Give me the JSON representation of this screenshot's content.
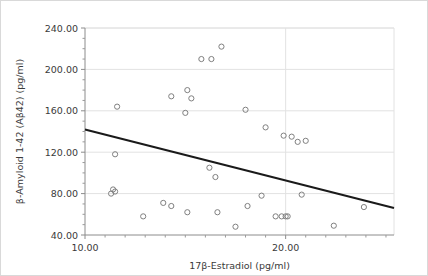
{
  "chart_data": {
    "type": "scatter",
    "title": "",
    "xlabel": "17β-Estradiol (pg/ml)",
    "ylabel": "β-Amyloid 1-42 (Aβ42) (pg/ml)",
    "xlim": [
      10.0,
      25.4
    ],
    "ylim": [
      40.0,
      240.0
    ],
    "xticks": [
      10.0,
      20.0
    ],
    "xtick_labels": [
      "10.00",
      "20.00"
    ],
    "yticks": [
      40.0,
      80.0,
      120.0,
      160.0,
      200.0,
      240.0
    ],
    "ytick_labels": [
      "40.00",
      "80.00",
      "120.00",
      "160.00",
      "200.00",
      "240.00"
    ],
    "grid": true,
    "grid_color": "#e2e2e2",
    "marker": "open-circle",
    "marker_color": "#808080",
    "legend": "none",
    "points": [
      {
        "x": 11.6,
        "y": 164.0
      },
      {
        "x": 11.5,
        "y": 118.0
      },
      {
        "x": 11.4,
        "y": 84.0
      },
      {
        "x": 11.3,
        "y": 80.0
      },
      {
        "x": 11.5,
        "y": 82.0
      },
      {
        "x": 12.9,
        "y": 58.0
      },
      {
        "x": 13.9,
        "y": 71.0
      },
      {
        "x": 14.3,
        "y": 68.0
      },
      {
        "x": 14.3,
        "y": 174.0
      },
      {
        "x": 15.0,
        "y": 158.0
      },
      {
        "x": 15.1,
        "y": 180.0
      },
      {
        "x": 15.3,
        "y": 172.0
      },
      {
        "x": 15.1,
        "y": 62.0
      },
      {
        "x": 15.8,
        "y": 210.0
      },
      {
        "x": 16.3,
        "y": 210.0
      },
      {
        "x": 16.8,
        "y": 222.0
      },
      {
        "x": 16.2,
        "y": 105.0
      },
      {
        "x": 16.5,
        "y": 96.0
      },
      {
        "x": 16.6,
        "y": 62.0
      },
      {
        "x": 17.5,
        "y": 48.0
      },
      {
        "x": 18.0,
        "y": 161.0
      },
      {
        "x": 18.1,
        "y": 68.0
      },
      {
        "x": 18.8,
        "y": 78.0
      },
      {
        "x": 19.0,
        "y": 144.0
      },
      {
        "x": 19.5,
        "y": 58.0
      },
      {
        "x": 19.8,
        "y": 58.0
      },
      {
        "x": 20.0,
        "y": 58.0
      },
      {
        "x": 20.1,
        "y": 58.0
      },
      {
        "x": 19.9,
        "y": 136.0
      },
      {
        "x": 20.3,
        "y": 135.0
      },
      {
        "x": 20.6,
        "y": 130.0
      },
      {
        "x": 21.0,
        "y": 131.0
      },
      {
        "x": 20.8,
        "y": 79.0
      },
      {
        "x": 22.4,
        "y": 49.0
      },
      {
        "x": 23.9,
        "y": 67.0
      }
    ],
    "trendline": {
      "label": "linear-fit",
      "color": "#1a1a1a",
      "x_start": 10.0,
      "y_start": 142.0,
      "x_end": 25.4,
      "y_end": 66.0
    }
  }
}
